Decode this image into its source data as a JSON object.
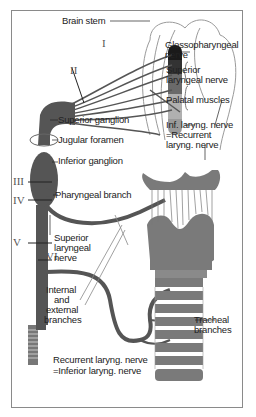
{
  "colors": {
    "nerve": "#555555",
    "cartilage": "#7a7a7a",
    "outline": "#8a8a8a",
    "text": "#222222",
    "dark_segment": "#1a1a1a"
  },
  "roman_numerals": [
    "I",
    "II",
    "III",
    "IV",
    "V",
    "VI"
  ],
  "labels": {
    "brain_stem": "Brain stem",
    "glossopharyngeal_1": "Glossopharyngeal",
    "glossopharyngeal_2": "nerve",
    "superior_laryngeal_top_1": "Superior",
    "superior_laryngeal_top_2": "laryngeal nerve",
    "palatal_muscles": "Palatal muscles",
    "inf_laryng_1": "Inf. laryng. nerve",
    "inf_laryng_2": "=Recurrent",
    "inf_laryng_3": "laryng. nerve",
    "superior_ganglion": "Superior ganglion",
    "jugular_foramen": "Jugular foramen",
    "inferior_ganglion": "Inferior ganglion",
    "pharyngeal_branch": "Pharyngeal branch",
    "superior_laryngeal_1": "Superior",
    "superior_laryngeal_2": "laryngeal",
    "superior_laryngeal_3": "nerve",
    "internal_external_1": "Internal",
    "internal_external_2": "and",
    "internal_external_3": "external",
    "internal_external_4": "branches",
    "tracheal_1": "Tracheal",
    "tracheal_2": "branches",
    "recurrent_bottom_1": "Recurrent laryng. nerve",
    "recurrent_bottom_2": "=Inferior laryng. nerve"
  }
}
